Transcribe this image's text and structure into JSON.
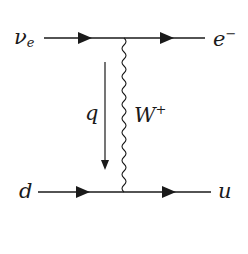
{
  "diagram": {
    "type": "feynman-diagram",
    "process": "charged-current neutrino-quark scattering",
    "colors": {
      "line": "#1a1a1a",
      "background": "#ffffff"
    },
    "particles": {
      "incoming_top": {
        "symbol": "ν",
        "subscript": "e"
      },
      "outgoing_top": {
        "symbol": "e",
        "superscript": "−"
      },
      "incoming_bottom": {
        "symbol": "d"
      },
      "outgoing_bottom": {
        "symbol": "u"
      },
      "boson": {
        "symbol": "W",
        "superscript": "+"
      },
      "momentum": {
        "symbol": "q"
      }
    }
  }
}
